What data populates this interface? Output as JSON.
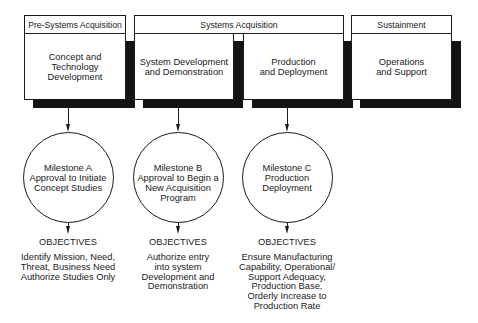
{
  "phases": [
    {
      "label": "Pre-Systems Acquisition"
    },
    {
      "label": "Systems Acquisition"
    },
    {
      "label": "Sustainment"
    }
  ],
  "activities": [
    {
      "label": "Concept and\nTechnology\nDevelopment"
    },
    {
      "label": "System Development\nand Demonstration"
    },
    {
      "label": "Production\nand Deployment"
    },
    {
      "label": "Operations\nand Support"
    }
  ],
  "milestones": [
    {
      "label": "Milestone A\nApproval to Initiate\nConcept Studies",
      "objectives_heading": "OBJECTIVES",
      "objectives": "Identify Mission, Need,\nThreat, Business Need\nAuthorize Studies Only"
    },
    {
      "label": "Milestone B\nApproval to Begin a\nNew Acquisition\nProgram",
      "objectives_heading": "OBJECTIVES",
      "objectives": "Authorize entry\ninto system\nDevelopment and\nDemonstration"
    },
    {
      "label": "Milestone C\nProduction\nDeployment",
      "objectives_heading": "OBJECTIVES",
      "objectives": "Ensure Manufacturing\nCapability, Operational/\nSupport Adequacy,\nProduction Base,\nOrderly Increase to\nProduction Rate"
    }
  ],
  "colors": {
    "line": "#1a1a1a",
    "shadow": "#141414",
    "background": "#ffffff"
  }
}
